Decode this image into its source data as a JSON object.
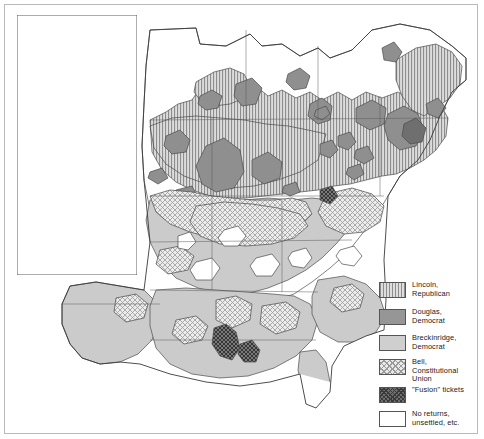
{
  "map": {
    "title": "Presidential Election of 1860 — county vote by party",
    "inset_region": "Pacific Coast (California, Oregon, Washington Territory, Nevada)",
    "main_region": "Eastern and Midwestern United States"
  },
  "legend": {
    "name": "map-legend",
    "items": [
      {
        "id": "lincoln",
        "swatch": "vertical-stripe",
        "color": "#cfcfcf",
        "label": "Lincoln,\nRepublican"
      },
      {
        "id": "douglas",
        "swatch": "solid-dark-gray",
        "color": "#969696",
        "label": "Douglas,\nDemocrat"
      },
      {
        "id": "breckinridge",
        "swatch": "solid-light-gray",
        "color": "#cfcfcf",
        "label": "Breckinridge,\nDemocrat"
      },
      {
        "id": "bell",
        "swatch": "diagonal-crosshatch",
        "color": "#eaeaea",
        "label": "Bell,\nConstitutional\nUnion"
      },
      {
        "id": "fusion",
        "swatch": "dark-crosshatch",
        "color": "#6e6e6e",
        "label": "\"Fusion\" tickets"
      },
      {
        "id": "none",
        "swatch": "white",
        "color": "#ffffff",
        "label": "No returns,\nunsettled, etc."
      }
    ]
  },
  "colors": {
    "lincoln_fill": "#cfcfcf",
    "lincoln_stripe": "#8d8d8d",
    "douglas_fill": "#969696",
    "breckinridge_fill": "#cbcbcb",
    "bell_fill": "#e7e7e7",
    "bell_hatch": "#9a9a9a",
    "fusion_fill": "#6e6e6e",
    "none_fill": "#ffffff",
    "outline": "#4a4a4a",
    "frame": "#b9b9b9",
    "text": "#1a1a1a"
  }
}
